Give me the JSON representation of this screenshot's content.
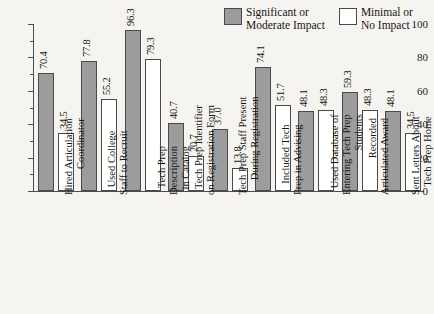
{
  "chart_data": {
    "type": "bar",
    "title": "",
    "subtitle": "",
    "xlabel": "",
    "ylabel": "",
    "ylim": [
      0,
      100
    ],
    "yticks": [
      0,
      20,
      40,
      60,
      80,
      100
    ],
    "ytick_labels": [
      "0",
      "20",
      "40",
      "60",
      "80",
      "100"
    ],
    "y_minor_ticks": [
      10,
      30,
      50,
      70,
      90
    ],
    "grid": false,
    "legend_position": "top-right",
    "categories": [
      "Hired Articulation Coordinator",
      "Used College Staff to Recruit",
      "Tech Prep Description in Catalog",
      "Tech Prep Identifier on Registration Form",
      "Tech Prep Staff Present During Registration",
      "Included Tech Prep in Advising",
      "Used Database of Entering Tech Prep Students",
      "Recorded Articulated Award",
      "Sent Letters About Tech Prep Home"
    ],
    "category_lines": [
      [
        "Hired Articulation",
        "Coordinator"
      ],
      [
        "Used College",
        "Staff to Recruit"
      ],
      [
        "Tech Prep",
        "Description",
        "in Catalog"
      ],
      [
        "Tech Prep Identifier",
        "on Registration Form"
      ],
      [
        "Tech Prep Staff Present",
        "During Registration"
      ],
      [
        "Included Tech",
        "Prep in Advising"
      ],
      [
        "Used Database of",
        "Entering Tech Prep",
        "Students"
      ],
      [
        "Recorded",
        "Articulated Award"
      ],
      [
        "Sent Letters About",
        "Tech Prep Home"
      ]
    ],
    "series": [
      {
        "name": "Significant or Moderate Impact",
        "color": "#9c9c9c",
        "values": [
          70.4,
          77.8,
          96.3,
          40.7,
          37.0,
          74.1,
          48.1,
          59.3,
          48.1
        ]
      },
      {
        "name": "Minimal or No Impact",
        "color": "#ffffff",
        "values": [
          34.5,
          55.2,
          79.3,
          20.7,
          13.8,
          51.7,
          48.3,
          48.3,
          34.5
        ]
      }
    ]
  },
  "legend": {
    "entries": [
      {
        "label": "Significant or\nModerate Impact",
        "swatch": "filled"
      },
      {
        "label": "Minimal or\nNo Impact",
        "swatch": "hollow"
      }
    ]
  },
  "colors": {
    "background": "#f6f4f0",
    "axis": "#4d4d4d",
    "bar_fill_significant": "#9c9c9c",
    "bar_fill_minimal": "#ffffff",
    "bar_border": "#4a4a4a",
    "text": "#151515"
  }
}
